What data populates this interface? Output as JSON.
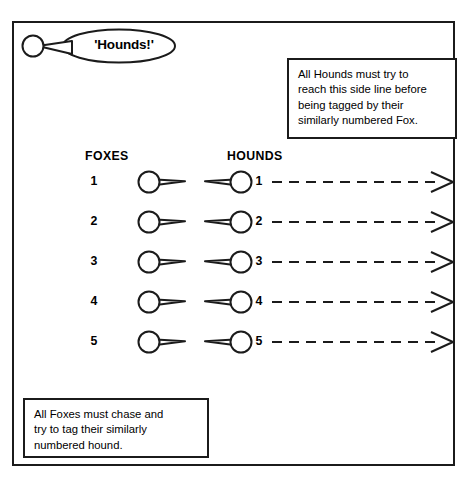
{
  "page": {
    "cropped_caption": "",
    "background_color": "#ffffff",
    "ink_color": "#1b1b1b"
  },
  "field": {
    "name": "playing-field",
    "side_line_label": "right side line"
  },
  "shout": {
    "caller_icon": "player-head-circle-icon",
    "balloon_icon": "speech-balloon-icon",
    "text": "'Hounds!'"
  },
  "columns": {
    "foxes_heading": "FOXES",
    "hounds_heading": "HOUNDS"
  },
  "notes": [
    {
      "id": "hounds-note",
      "text": "All Hounds must try to\nreach this side line before\nbeing tagged by their\nsimilarly numbered Fox."
    },
    {
      "id": "foxes-note",
      "text": "All Foxes must chase and\ntry to tag their similarly\nnumbered hound."
    }
  ],
  "rows": [
    {
      "fox_number": "1",
      "hound_number": "1",
      "fox_icon": "fox-player-icon",
      "hound_icon": "hound-player-icon",
      "arrow_icon": "dashed-arrow-right-icon"
    },
    {
      "fox_number": "2",
      "hound_number": "2",
      "fox_icon": "fox-player-icon",
      "hound_icon": "hound-player-icon",
      "arrow_icon": "dashed-arrow-right-icon"
    },
    {
      "fox_number": "3",
      "hound_number": "3",
      "fox_icon": "fox-player-icon",
      "hound_icon": "hound-player-icon",
      "arrow_icon": "dashed-arrow-right-icon"
    },
    {
      "fox_number": "4",
      "hound_number": "4",
      "fox_icon": "fox-player-icon",
      "hound_icon": "hound-player-icon",
      "arrow_icon": "dashed-arrow-right-icon"
    },
    {
      "fox_number": "5",
      "hound_number": "5",
      "fox_icon": "fox-player-icon",
      "hound_icon": "hound-player-icon",
      "arrow_icon": "dashed-arrow-right-icon"
    }
  ]
}
